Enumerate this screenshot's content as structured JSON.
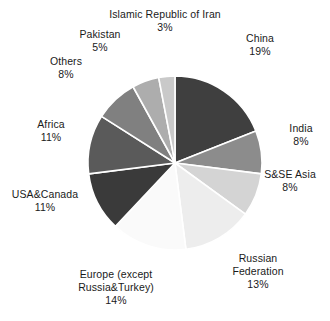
{
  "chart_data": {
    "type": "pie",
    "title": "",
    "subtitle": "",
    "xlabel": "",
    "ylabel": "",
    "legend_position": "outside-labels",
    "grid": false,
    "start_angle_deg": 0,
    "direction": "clockwise",
    "total_percent": 100,
    "categories": [
      "China",
      "India",
      "S&SE Asia",
      "Russian Federation",
      "Europe (except Russia&Turkey)",
      "USA&Canada",
      "Africa",
      "Others",
      "Pakistan",
      "Islamic Republic of Iran"
    ],
    "values": [
      19,
      8,
      8,
      13,
      14,
      11,
      11,
      8,
      5,
      3
    ],
    "value_labels": [
      "19%",
      "8%",
      "8%",
      "13%",
      "14%",
      "11%",
      "11%",
      "8%",
      "5%",
      "3%"
    ],
    "colors": [
      "#3f3f3f",
      "#8c8c8c",
      "#d4d4d4",
      "#ededed",
      "#fafafa",
      "#3a3a3a",
      "#5a5a5a",
      "#808080",
      "#adadad",
      "#c9c9c9"
    ],
    "slice_border_color": "#ffffff",
    "background_color": "#ffffff",
    "text_color": "#1a1a1a",
    "slices": [
      {
        "name": "China",
        "value": 19,
        "label": "19%",
        "color": "#3f3f3f"
      },
      {
        "name": "India",
        "value": 8,
        "label": "8%",
        "color": "#8c8c8c"
      },
      {
        "name": "S&SE Asia",
        "value": 8,
        "label": "8%",
        "color": "#d4d4d4"
      },
      {
        "name": "Russian Federation",
        "value": 13,
        "label": "13%",
        "color": "#ededed"
      },
      {
        "name": "Europe (except Russia&Turkey)",
        "value": 14,
        "label": "14%",
        "color": "#fafafa"
      },
      {
        "name": "USA&Canada",
        "value": 11,
        "label": "11%",
        "color": "#3a3a3a"
      },
      {
        "name": "Africa",
        "value": 11,
        "label": "11%",
        "color": "#5a5a5a"
      },
      {
        "name": "Others",
        "value": 8,
        "label": "8%",
        "color": "#808080"
      },
      {
        "name": "Pakistan",
        "value": 5,
        "label": "5%",
        "color": "#adadad"
      },
      {
        "name": "Islamic Republic of Iran",
        "value": 3,
        "label": "3%",
        "color": "#c9c9c9"
      }
    ]
  },
  "labels": {
    "china": {
      "name": "China",
      "value": "19%"
    },
    "india": {
      "name": "India",
      "value": "8%"
    },
    "ssea": {
      "name": "S&SE Asia",
      "value": "8%"
    },
    "russia": {
      "name": "Russian\nFederation",
      "line1": "Russian",
      "line2": "Federation",
      "value": "13%"
    },
    "europe": {
      "name": "Europe (except Russia&Turkey)",
      "line1": "Europe (except",
      "line2": "Russia&Turkey)",
      "value": "14%"
    },
    "usacanada": {
      "name": "USA&Canada",
      "value": "11%"
    },
    "africa": {
      "name": "Africa",
      "value": "11%"
    },
    "others": {
      "name": "Others",
      "value": "8%"
    },
    "pakistan": {
      "name": "Pakistan",
      "value": "5%"
    },
    "iran": {
      "name": "Islamic Republic of Iran",
      "value": "3%"
    }
  }
}
